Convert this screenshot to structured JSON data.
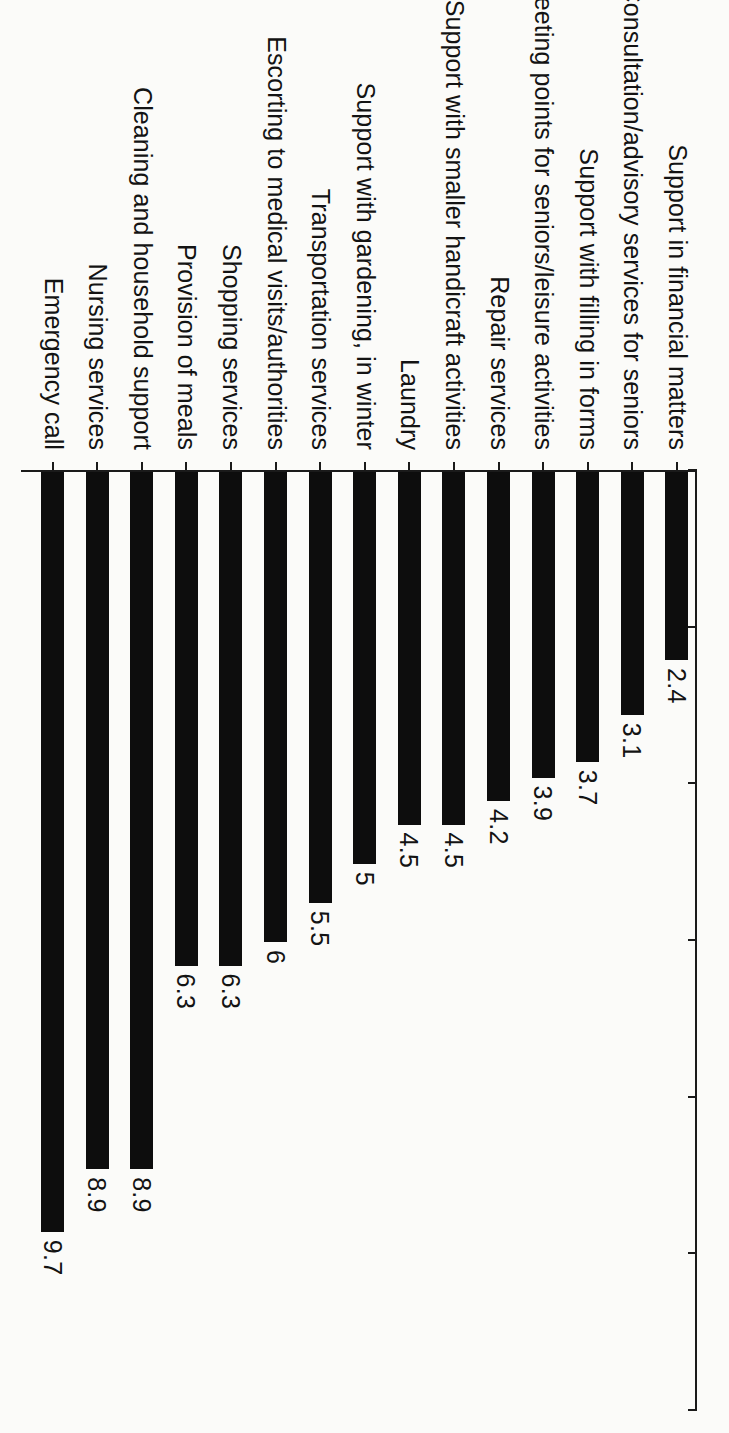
{
  "chart_data": {
    "type": "bar",
    "orientation": "horizontal",
    "title": "",
    "subtitle": "",
    "xlabel": "",
    "ylabel": "",
    "xlim": [
      0,
      12
    ],
    "xticks": [
      "0",
      "2",
      "4",
      "6",
      "8",
      "10",
      "12"
    ],
    "grid": false,
    "legend": null,
    "bar_color": "#0d0d0d",
    "background_color": "#fbfbf9",
    "axis_color": "#1a1a1a",
    "categories": [
      "Support in financial matters",
      "Consultation/advisory services for seniors",
      "Support with filling in  forms",
      "Meeting points for seniors/leisure activities",
      "Repair services",
      "Support with smaller handicraft activities",
      "Laundry",
      "Support with gardening, in winter",
      "Transportation services",
      "Escorting to medical visits/authorities",
      "Shopping services",
      "Provision of meals",
      "Cleaning and household support",
      "Nursing services",
      "Emergency call"
    ],
    "values": [
      2.4,
      3.1,
      3.7,
      3.9,
      4.2,
      4.5,
      4.5,
      5,
      5.5,
      6,
      6.3,
      6.3,
      8.9,
      8.9,
      9.7
    ],
    "value_labels": [
      "2.4",
      "3.1",
      "3.7",
      "3.9",
      "4.2",
      "4.5",
      "4.5",
      "5",
      "5.5",
      "6",
      "6.3",
      "6.3",
      "8.9",
      "8.9",
      "9.7"
    ]
  }
}
